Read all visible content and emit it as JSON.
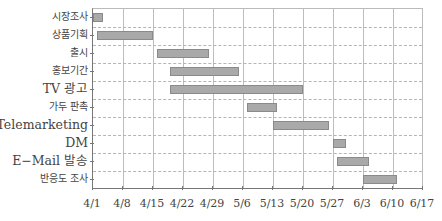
{
  "chart_data": {
    "type": "gantt",
    "title": "",
    "xlabel": "",
    "ylabel": "",
    "x_ticks": [
      "4/1",
      "4/8",
      "4/15",
      "4/22",
      "4/29",
      "5/6",
      "5/13",
      "5/20",
      "5/27",
      "6/3",
      "6/10",
      "6/17"
    ],
    "x_range_days": [
      0,
      77
    ],
    "x_origin": "4/1",
    "grid": {
      "vertical": "solid",
      "horizontal": "dashed"
    },
    "bar_color": "#a9a9a9",
    "bar_border_color": "#8a8a8a",
    "tasks": [
      {
        "name": "시장조사",
        "start": "4/1",
        "end": "4/3",
        "start_day": 0,
        "end_day": 2.3,
        "big": false
      },
      {
        "name": "상품기획",
        "start": "4/2",
        "end": "4/15",
        "start_day": 1,
        "end_day": 14,
        "big": false
      },
      {
        "name": "출시",
        "start": "4/16",
        "end": "4/28",
        "start_day": 15,
        "end_day": 27,
        "big": false
      },
      {
        "name": "홍보기간",
        "start": "4/19",
        "end": "5/5",
        "start_day": 18,
        "end_day": 34,
        "big": false
      },
      {
        "name": "TV 광고",
        "start": "4/19",
        "end": "5/20",
        "start_day": 18,
        "end_day": 49,
        "big": true
      },
      {
        "name": "가두 판촉",
        "start": "5/7",
        "end": "5/14",
        "start_day": 36,
        "end_day": 43,
        "big": false
      },
      {
        "name": "Telemarketing",
        "start": "5/13",
        "end": "5/26",
        "start_day": 42,
        "end_day": 55,
        "big": true
      },
      {
        "name": "DM",
        "start": "5/27",
        "end": "5/30",
        "start_day": 56,
        "end_day": 59,
        "big": true
      },
      {
        "name": "E-Mail 발송",
        "start": "5/28",
        "end": "6/4",
        "start_day": 57,
        "end_day": 64.5,
        "big": true
      },
      {
        "name": "반응도 조사",
        "start": "6/3",
        "end": "6/11",
        "start_day": 63,
        "end_day": 71,
        "big": false
      }
    ]
  },
  "labels": {
    "tasks": [
      "시장조사",
      "상품기획",
      "출시",
      "홍보기간",
      "TV 광고",
      "가두 판촉",
      "Telemarketing",
      "DM",
      "E−Mail 발송",
      "반응도 조사"
    ],
    "x_ticks": [
      "4/1",
      "4/8",
      "4/15",
      "4/22",
      "4/29",
      "5/6",
      "5/13",
      "5/20",
      "5/27",
      "6/3",
      "6/10",
      "6/17"
    ]
  }
}
